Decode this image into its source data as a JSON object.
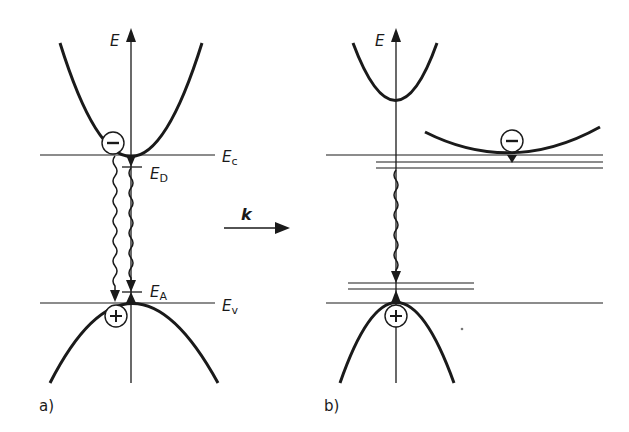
{
  "figure": {
    "panel_a": {
      "label": "a)",
      "axis_label": "E",
      "conduction_edge": {
        "main": "E",
        "sub": "c"
      },
      "donor_level": {
        "main": "E",
        "sub": "D"
      },
      "acceptor_level": {
        "main": "E",
        "sub": "A"
      },
      "valence_edge": {
        "main": "E",
        "sub": "v"
      },
      "electron_symbol": "−",
      "hole_symbol": "+"
    },
    "k_arrow": {
      "label": "k"
    },
    "panel_b": {
      "label": "b)",
      "axis_label": "E",
      "electron_symbol": "−",
      "hole_symbol": "+"
    },
    "colors": {
      "ink": "#1a1a1a",
      "background": "#ffffff"
    }
  }
}
